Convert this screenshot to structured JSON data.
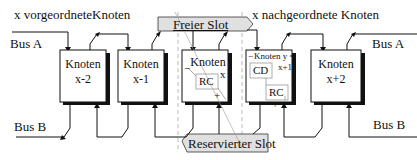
{
  "labels": {
    "upstream": "x vorgeordneteKnoten",
    "downstream": "x nachgeordnete Knoten",
    "bus_a_left": "Bus A",
    "bus_a_right": "Bus A",
    "bus_b_left": "Bus B",
    "bus_b_right": "Bus B",
    "free_slot": "Freier Slot",
    "reserved_slot": "Reservierter Slot"
  },
  "nodes": [
    {
      "title": "Knoten",
      "sub": "x-2"
    },
    {
      "title": "Knoten",
      "sub": "x-1"
    },
    {
      "title": "Knoten",
      "sub": "x",
      "inner": "RC",
      "minus": "−",
      "plus": "+"
    },
    {
      "title": "Knoten y =",
      "sub": "x+1",
      "inner_top": "CD",
      "inner": "RC",
      "minus": "−",
      "plus": "+"
    },
    {
      "title": "Knoten",
      "sub": "x+2"
    }
  ],
  "colors": {
    "slot_fill": "#e0e0e0",
    "line": "#111111",
    "dashed": "#999999"
  }
}
